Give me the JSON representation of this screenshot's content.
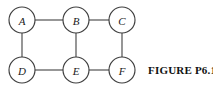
{
  "figure": {
    "caption": "FIGURE P6.1",
    "width": 213,
    "height": 90,
    "background_color": "#ffffff",
    "stroke_color": "#4a4a4a",
    "node_fill_color": "#ffffff",
    "label_color": "#1a1a1a",
    "caption_color": "#111111"
  },
  "chart_data": {
    "type": "diagram",
    "diagram_kind": "undirected-graph",
    "title": "FIGURE P6.1",
    "node_radius": 13,
    "nodes": [
      {
        "id": "A",
        "label": "A",
        "x": 22,
        "y": 20
      },
      {
        "id": "B",
        "label": "B",
        "x": 76,
        "y": 20
      },
      {
        "id": "C",
        "label": "C",
        "x": 122,
        "y": 20
      },
      {
        "id": "D",
        "label": "D",
        "x": 22,
        "y": 70
      },
      {
        "id": "E",
        "label": "E",
        "x": 76,
        "y": 70
      },
      {
        "id": "F",
        "label": "F",
        "x": 122,
        "y": 70
      }
    ],
    "edges": [
      {
        "from": "A",
        "to": "B"
      },
      {
        "from": "B",
        "to": "C"
      },
      {
        "from": "A",
        "to": "D"
      },
      {
        "from": "B",
        "to": "E"
      },
      {
        "from": "C",
        "to": "F"
      },
      {
        "from": "D",
        "to": "E"
      },
      {
        "from": "E",
        "to": "F"
      }
    ],
    "node_count": 6,
    "edge_count": 7,
    "directed": false,
    "weighted": false
  }
}
